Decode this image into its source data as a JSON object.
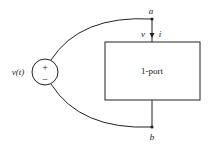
{
  "source": {
    "label": "v(t)",
    "plus": "+",
    "minus": "−"
  },
  "nodes": {
    "a": "a",
    "b": "b"
  },
  "port": {
    "label": "1-port",
    "voltage": "v",
    "current": "i"
  },
  "colors": {
    "stroke": "#222222",
    "bg": "#ffffff"
  }
}
